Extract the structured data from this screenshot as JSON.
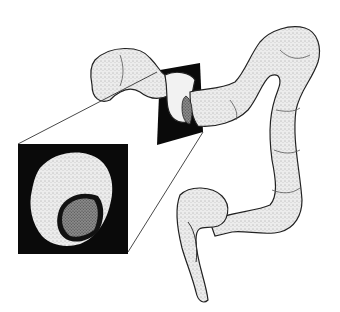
{
  "figure": {
    "inset": "magnified-lesion-view",
    "colors": {
      "background": "#ffffff",
      "ink": "#111111",
      "tissue": "#e6e6e6",
      "tissue_shade": "#bdbdbd",
      "lesion": "#6a6a6a",
      "inset_bg": "#0a0a0a"
    }
  }
}
